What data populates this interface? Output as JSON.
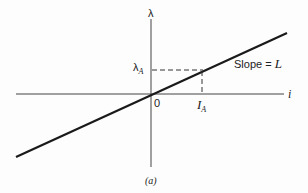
{
  "diagram": {
    "caption": "(a)",
    "axes": {
      "y_label": "λ",
      "x_label": "i",
      "origin_label": "0"
    },
    "marks": {
      "lambda_a_main": "λ",
      "lambda_a_sub": "A",
      "i_a_main": "I",
      "i_a_sub": "A"
    },
    "line_annotation": {
      "prefix": "Slope = ",
      "symbol": "L"
    },
    "colors": {
      "ink": "#222222",
      "background": "#fdfdfd"
    }
  }
}
